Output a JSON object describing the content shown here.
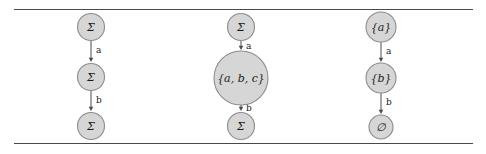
{
  "figure": {
    "background_color": "#ffffff",
    "rule_color": "#4a4a4a",
    "node_fill": "#d6d6d6",
    "node_stroke": "#8c8c8c",
    "edge_color": "#4d4d4d",
    "text_color": "#1a1a1a",
    "columns": [
      {
        "id": "column-left",
        "nodes": [
          {
            "id": "left-node-1",
            "label": "Σ",
            "cx": 91,
            "cy": 27,
            "r": 13.5,
            "font_size": 11
          },
          {
            "id": "left-node-2",
            "label": "Σ",
            "cx": 91,
            "cy": 77,
            "r": 13.5,
            "font_size": 11
          },
          {
            "id": "left-node-3",
            "label": "Σ",
            "cx": 91,
            "cy": 126,
            "r": 13.5,
            "font_size": 11
          }
        ],
        "edges": [
          {
            "id": "left-edge-a",
            "label": "a",
            "x": 91,
            "y1": 41,
            "y2": 62,
            "label_x": 96,
            "label_y": 50
          },
          {
            "id": "left-edge-b",
            "label": "b",
            "x": 91,
            "y1": 91,
            "y2": 111,
            "label_x": 96,
            "label_y": 100
          }
        ]
      },
      {
        "id": "column-middle",
        "nodes": [
          {
            "id": "mid-node-1",
            "label": "Σ",
            "cx": 241,
            "cy": 27,
            "r": 13.5,
            "font_size": 11
          },
          {
            "id": "mid-node-2",
            "label": "{a, b, c}",
            "cx": 241,
            "cy": 78,
            "r": 27.0,
            "font_size": 11
          },
          {
            "id": "mid-node-3",
            "label": "Σ",
            "cx": 241,
            "cy": 126,
            "r": 13.5,
            "font_size": 11
          }
        ],
        "edges": [
          {
            "id": "mid-edge-a",
            "label": "a",
            "x": 241,
            "y1": 41,
            "y2": 50,
            "label_x": 246,
            "label_y": 46
          },
          {
            "id": "mid-edge-b",
            "label": "b",
            "x": 241,
            "y1": 105,
            "y2": 111,
            "label_x": 246,
            "label_y": 108
          }
        ]
      },
      {
        "id": "column-right",
        "nodes": [
          {
            "id": "right-node-1",
            "label": "{a}",
            "cx": 381,
            "cy": 27,
            "r": 15.0,
            "font_size": 11
          },
          {
            "id": "right-node-2",
            "label": "{b}",
            "cx": 381,
            "cy": 78,
            "r": 15.0,
            "font_size": 11
          },
          {
            "id": "right-node-3",
            "label": "∅",
            "cx": 381,
            "cy": 127,
            "r": 12.0,
            "font_size": 11
          }
        ],
        "edges": [
          {
            "id": "right-edge-a",
            "label": "a",
            "x": 381,
            "y1": 42,
            "y2": 62,
            "label_x": 386,
            "label_y": 51
          },
          {
            "id": "right-edge-b",
            "label": "b",
            "x": 381,
            "y1": 93,
            "y2": 114,
            "label_x": 386,
            "label_y": 102
          }
        ]
      }
    ],
    "rules": [
      {
        "id": "rule-top",
        "x": 14,
        "y": 9,
        "width": 459
      },
      {
        "id": "rule-bottom",
        "x": 14,
        "y": 143,
        "width": 459
      }
    ]
  }
}
